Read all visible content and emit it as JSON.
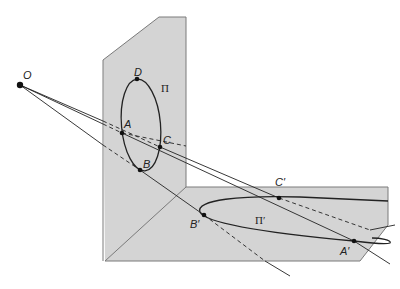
{
  "figure": {
    "colors": {
      "plane_fill": "#d4d4d4",
      "plane_edge": "#7a7a7a",
      "line": "#222222",
      "background": "#ffffff"
    },
    "labels": {
      "center": "O",
      "point_a": "A",
      "point_b": "B",
      "point_c": "C",
      "point_d": "D",
      "plane_vertical": "Π",
      "point_a_prime": "A′",
      "point_b_prime": "B′",
      "point_c_prime": "C′",
      "plane_horizontal": "Π′"
    }
  }
}
